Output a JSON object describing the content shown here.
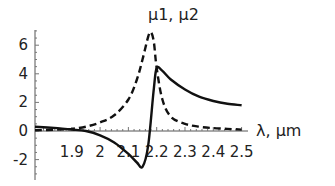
{
  "chart_data": {
    "type": "line",
    "title": "μ1, μ2",
    "xlabel": "λ, μm",
    "ylabel": "μ1, μ2",
    "xlim": [
      1.77,
      2.52
    ],
    "ylim": [
      -3,
      7
    ],
    "x_ticks": [
      "1.9",
      "2",
      "2.1",
      "2.2",
      "2.3",
      "2.4",
      "2.5"
    ],
    "y_ticks": [
      "6",
      "4",
      "2",
      "0",
      "-2"
    ],
    "grid": false,
    "legend": "none",
    "series": [
      {
        "name": "μ1 (solid)",
        "style": "solid",
        "x": [
          1.77,
          1.85,
          1.9,
          1.95,
          2.0,
          2.05,
          2.1,
          2.13,
          2.15,
          2.17,
          2.19,
          2.2,
          2.22,
          2.25,
          2.3,
          2.35,
          2.4,
          2.45,
          2.5
        ],
        "values": [
          0.3,
          0.2,
          0.1,
          0.0,
          -0.3,
          -0.8,
          -1.6,
          -2.2,
          -2.5,
          -1.0,
          3.0,
          4.4,
          4.2,
          3.6,
          2.9,
          2.4,
          2.1,
          1.9,
          1.8
        ]
      },
      {
        "name": "μ2 (dashed)",
        "style": "dashed",
        "x": [
          1.77,
          1.85,
          1.9,
          1.95,
          2.0,
          2.05,
          2.1,
          2.13,
          2.15,
          2.17,
          2.18,
          2.19,
          2.2,
          2.22,
          2.25,
          2.3,
          2.35,
          2.4,
          2.45,
          2.5
        ],
        "values": [
          0.05,
          0.1,
          0.15,
          0.3,
          0.6,
          1.1,
          2.2,
          3.6,
          5.0,
          6.6,
          6.9,
          6.2,
          4.4,
          2.2,
          1.0,
          0.5,
          0.3,
          0.2,
          0.15,
          0.1
        ]
      }
    ]
  }
}
